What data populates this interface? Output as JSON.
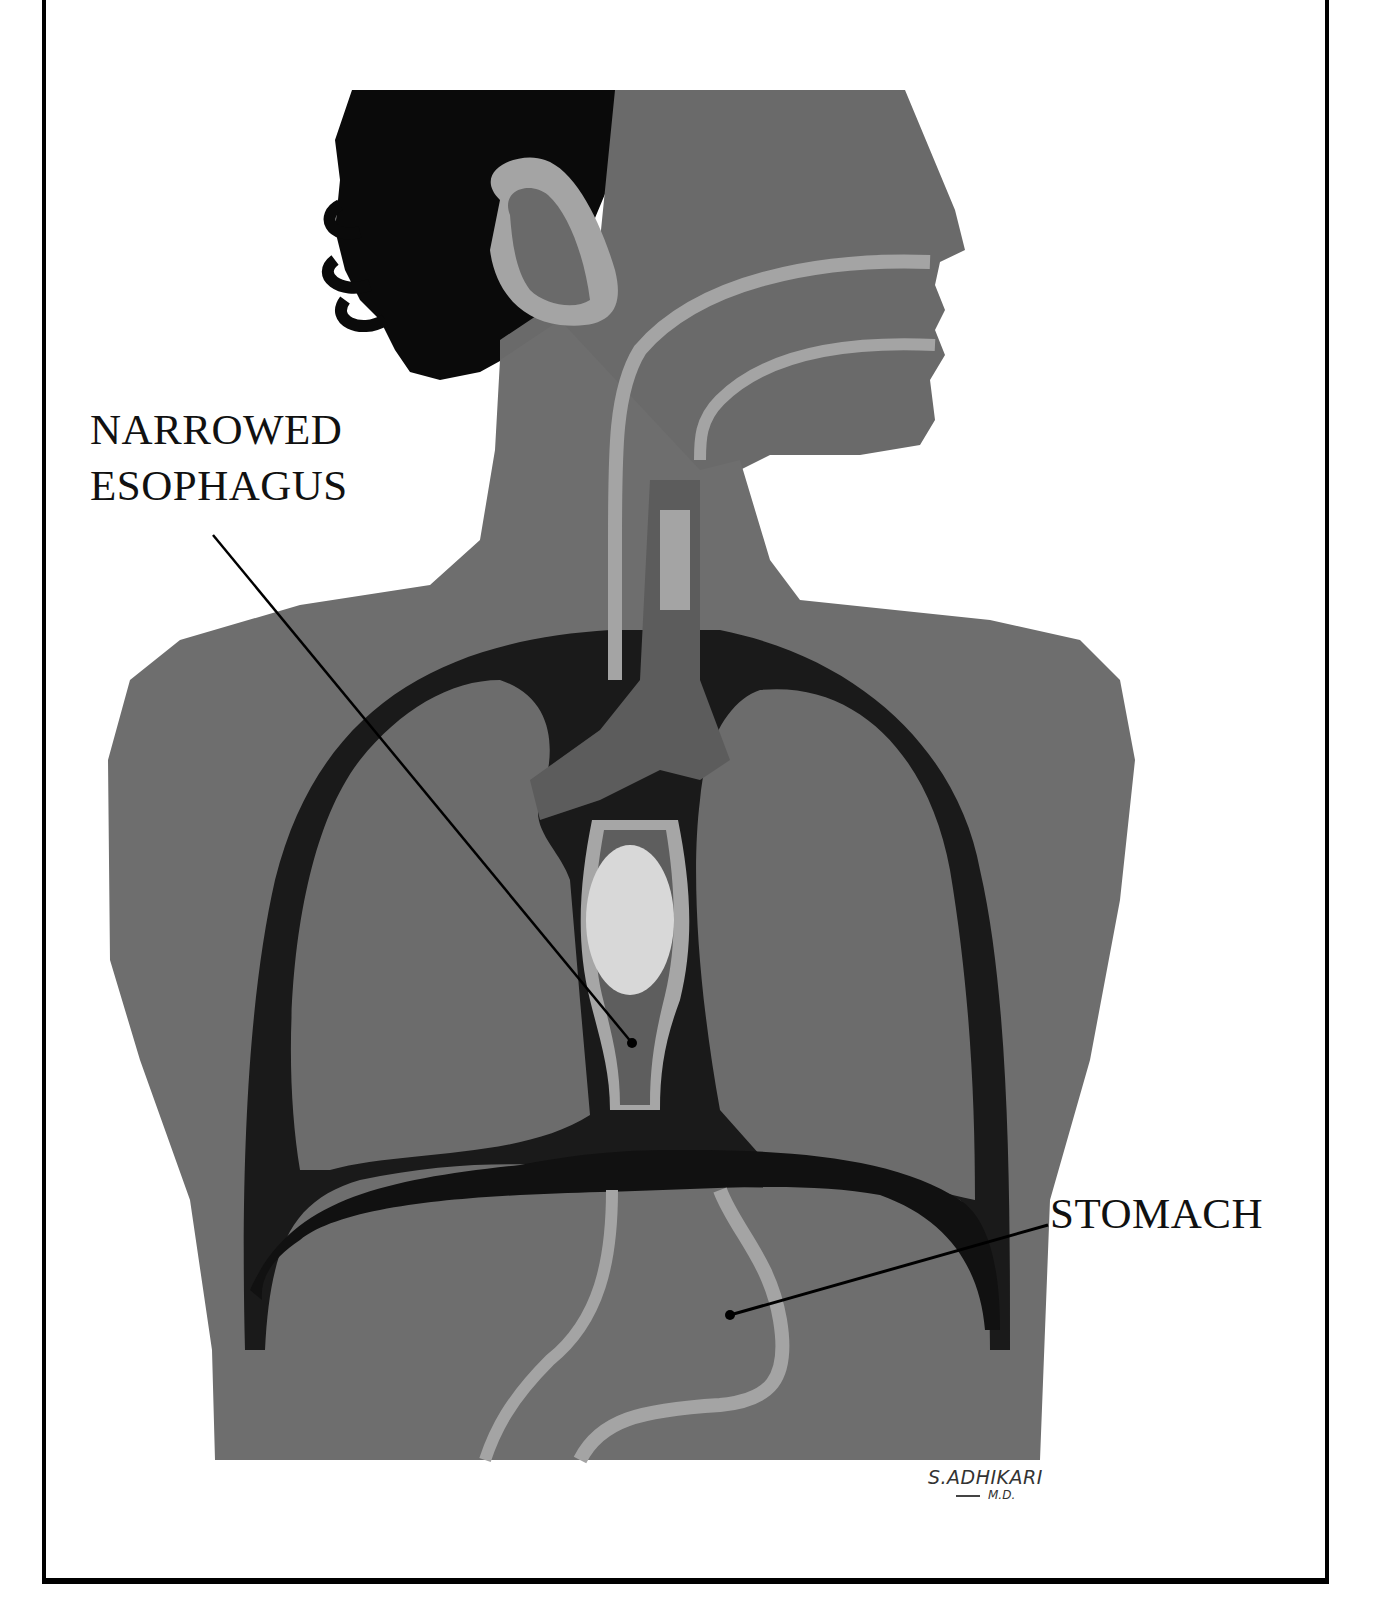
{
  "figure": {
    "labels": [
      {
        "id": "narrowed-esophagus",
        "lines": [
          "NARROWED",
          "ESOPHAGUS"
        ]
      },
      {
        "id": "stomach",
        "lines": [
          "STOMACH"
        ]
      }
    ],
    "signature": {
      "name": "S.ADHIKARI",
      "credential": "M.D."
    }
  },
  "colors": {
    "skin": "#6e6e6e",
    "skin_dark": "#5e5e5e",
    "hair": "#0a0a0a",
    "cavity": "#1a1a1a",
    "highlight": "#a8a8a8",
    "bolus": "#d8d8d8",
    "frame": "#000000"
  }
}
